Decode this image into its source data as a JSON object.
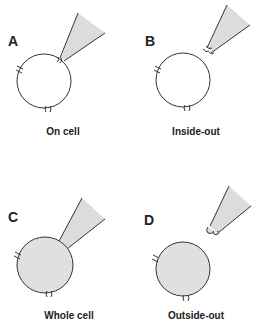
{
  "figure": {
    "panels": [
      {
        "letter": "A",
        "caption": "On cell",
        "cell_filled": false,
        "pipette_attached": true
      },
      {
        "letter": "B",
        "caption": "Inside-out",
        "cell_filled": false,
        "pipette_attached": false
      },
      {
        "letter": "C",
        "caption": "Whole cell",
        "cell_filled": true,
        "pipette_attached": true
      },
      {
        "letter": "D",
        "caption": "Outside-out",
        "cell_filled": true,
        "pipette_attached": false
      }
    ],
    "colors": {
      "stroke": "#333333",
      "fill": "#e0e0e0",
      "pipette_fill": "#dcdcdc"
    }
  }
}
